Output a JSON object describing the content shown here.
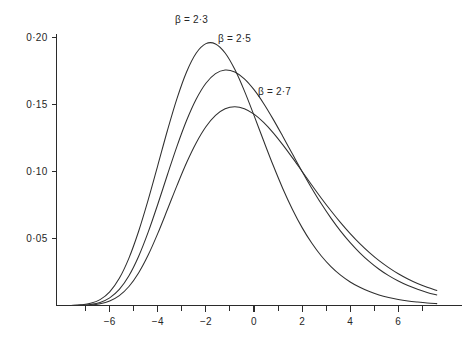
{
  "figure": {
    "title": "",
    "background_color": "#ffffff",
    "line_color": "#2f2f2f",
    "axis_color": "#2b2b2b"
  },
  "chart_data": {
    "type": "line",
    "title": "",
    "xlabel": "",
    "ylabel": "",
    "xlim": [
      -7.6,
      7.6
    ],
    "ylim": [
      0,
      0.215
    ],
    "grid": false,
    "legend_position": "inline-annotations",
    "x_ticks": [
      {
        "value": -6,
        "label": "−6"
      },
      {
        "value": -4,
        "label": "−4"
      },
      {
        "value": -2,
        "label": "−2"
      },
      {
        "value": 0,
        "label": "0"
      },
      {
        "value": 2,
        "label": "2"
      },
      {
        "value": 4,
        "label": "4"
      },
      {
        "value": 6,
        "label": "6"
      }
    ],
    "x_minor_ticks": [
      -7,
      -5,
      -3,
      -1,
      1,
      3,
      5,
      7
    ],
    "y_ticks": [
      {
        "value": 0.05,
        "label": "0·05"
      },
      {
        "value": 0.1,
        "label": "0·10"
      },
      {
        "value": 0.15,
        "label": "0·15"
      },
      {
        "value": 0.2,
        "label": "0·20"
      }
    ],
    "annotations": [
      {
        "text": "β = 2·3",
        "x_px": 175,
        "y_px": 23
      },
      {
        "text": "β = 2·5",
        "x_px": 218,
        "y_px": 42
      },
      {
        "text": "β = 2·7",
        "x_px": 258,
        "y_px": 95
      }
    ],
    "series": [
      {
        "name": "β = 2·3",
        "beta": 2.3,
        "peak_x": -3.2,
        "peak_y": 0.2,
        "x": [
          -7.6,
          -7.2,
          -6.8,
          -6.4,
          -6.0,
          -5.6,
          -5.2,
          -4.8,
          -4.4,
          -4.0,
          -3.6,
          -3.2,
          -2.8,
          -2.4,
          -2.0,
          -1.6,
          -1.2,
          -0.8,
          -0.4,
          0.0,
          0.4,
          0.8,
          1.2,
          1.6,
          2.0,
          2.4,
          2.8,
          3.2,
          3.6,
          4.0,
          4.4,
          4.8,
          5.2,
          5.6,
          6.0,
          6.4,
          6.8,
          7.2,
          7.6
        ],
        "y": [
          0.0,
          0.0005,
          0.0016,
          0.0044,
          0.0102,
          0.0203,
          0.0354,
          0.0553,
          0.0789,
          0.1047,
          0.1308,
          0.1548,
          0.1747,
          0.1887,
          0.1957,
          0.1955,
          0.1887,
          0.1765,
          0.1604,
          0.1421,
          0.1231,
          0.1046,
          0.0873,
          0.0718,
          0.0582,
          0.0467,
          0.037,
          0.0291,
          0.0227,
          0.0176,
          0.0136,
          0.0104,
          0.0079,
          0.006,
          0.0045,
          0.0034,
          0.0026,
          0.0019,
          0.0014
        ]
      },
      {
        "name": "β = 2·5",
        "beta": 2.5,
        "peak_x": -1.8,
        "peak_y": 0.195,
        "x": [
          -7.6,
          -7.2,
          -6.8,
          -6.4,
          -6.0,
          -5.6,
          -5.2,
          -4.8,
          -4.4,
          -4.0,
          -3.6,
          -3.2,
          -2.8,
          -2.4,
          -2.0,
          -1.6,
          -1.2,
          -0.8,
          -0.4,
          0.0,
          0.4,
          0.8,
          1.2,
          1.6,
          2.0,
          2.4,
          2.8,
          3.2,
          3.6,
          4.0,
          4.4,
          4.8,
          5.2,
          5.6,
          6.0,
          6.4,
          6.8,
          7.2,
          7.6
        ],
        "y": [
          0.0,
          0.0002,
          0.0008,
          0.0023,
          0.0057,
          0.012,
          0.0222,
          0.0366,
          0.0548,
          0.0757,
          0.0977,
          0.1191,
          0.1384,
          0.1543,
          0.1661,
          0.1733,
          0.176,
          0.1745,
          0.1694,
          0.1613,
          0.151,
          0.1391,
          0.1263,
          0.1132,
          0.1002,
          0.0877,
          0.076,
          0.0653,
          0.0556,
          0.047,
          0.0394,
          0.0328,
          0.0271,
          0.0223,
          0.0183,
          0.0149,
          0.0121,
          0.0098,
          0.0079
        ]
      },
      {
        "name": "β = 2·7",
        "beta": 2.7,
        "peak_x": -0.5,
        "peak_y": 0.175,
        "x": [
          -7.6,
          -7.2,
          -6.8,
          -6.4,
          -6.0,
          -5.6,
          -5.2,
          -4.8,
          -4.4,
          -4.0,
          -3.6,
          -3.2,
          -2.8,
          -2.4,
          -2.0,
          -1.6,
          -1.2,
          -0.8,
          -0.4,
          0.0,
          0.4,
          0.8,
          1.2,
          1.6,
          2.0,
          2.4,
          2.8,
          3.2,
          3.6,
          4.0,
          4.4,
          4.8,
          5.2,
          5.6,
          6.0,
          6.4,
          6.8,
          7.2,
          7.6
        ],
        "y": [
          0.0,
          0.0001,
          0.0004,
          0.0013,
          0.0034,
          0.0074,
          0.0142,
          0.0243,
          0.0377,
          0.0539,
          0.0717,
          0.0898,
          0.1069,
          0.1217,
          0.1336,
          0.1421,
          0.147,
          0.1486,
          0.1471,
          0.143,
          0.1368,
          0.129,
          0.12,
          0.1103,
          0.1002,
          0.0901,
          0.0802,
          0.0708,
          0.0619,
          0.0537,
          0.0462,
          0.0395,
          0.0335,
          0.0283,
          0.0237,
          0.0198,
          0.0164,
          0.0136,
          0.0112
        ]
      }
    ]
  }
}
